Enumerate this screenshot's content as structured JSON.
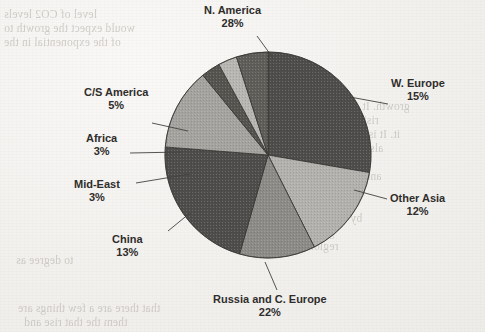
{
  "page": {
    "media": "scanned-document-page",
    "background_color": "#f2f1ee",
    "showthrough_text": [
      {
        "text": "level of CO2 levels",
        "x": 4,
        "y": 8
      },
      {
        "text": "would expect the growth to",
        "x": 4,
        "y": 22
      },
      {
        "text": "of the exponential in the",
        "x": 4,
        "y": 36
      },
      {
        "text": "in build-up in",
        "x": 272,
        "y": 86
      },
      {
        "text": "growth. It is the models",
        "x": 296,
        "y": 100
      },
      {
        "text": "rising levels and",
        "x": 300,
        "y": 114
      },
      {
        "text": "it. It is a very limit-",
        "x": 306,
        "y": 128
      },
      {
        "text": "also the rate of",
        "x": 312,
        "y": 142
      },
      {
        "text": "is of the only",
        "x": 304,
        "y": 156
      },
      {
        "text": "and rise to 20 per",
        "x": 298,
        "y": 170
      },
      {
        "text": "in the last a result",
        "x": 280,
        "y": 184
      },
      {
        "text": "as it is a sized",
        "x": 276,
        "y": 198
      },
      {
        "text": "by reduce to effects",
        "x": 268,
        "y": 212
      },
      {
        "text": "growth, without",
        "x": 258,
        "y": 226
      },
      {
        "text": "regional than the the",
        "x": 240,
        "y": 240
      },
      {
        "text": "to degree as",
        "x": 16,
        "y": 254
      },
      {
        "text": "that there are a few things are",
        "x": 18,
        "y": 302
      },
      {
        "text": "them the that rise and",
        "x": 24,
        "y": 316
      }
    ]
  },
  "chart_data": {
    "type": "pie",
    "title": "",
    "legend_position": "callout-labels",
    "grid": false,
    "total_percent": 101,
    "center": {
      "x": 268,
      "y": 155
    },
    "radius": 103,
    "start_angle_deg": 0,
    "direction": "clockwise",
    "categories": [
      "N. America",
      "W. Europe",
      "Other Asia",
      "Russia and C. Europe",
      "China",
      "Mid-East",
      "Africa",
      "C/S America"
    ],
    "values": [
      28,
      15,
      12,
      22,
      13,
      3,
      3,
      5
    ],
    "slices": [
      {
        "label": "N. America",
        "value": 28,
        "percent_text": "28%",
        "fill": "#4f4d4b",
        "label_pos": {
          "x": 204,
          "y": 4
        },
        "label_align": "center",
        "leader": {
          "x1": 257,
          "y1": 36,
          "x2": 273,
          "y2": 58
        }
      },
      {
        "label": "W. Europe",
        "value": 15,
        "percent_text": "15%",
        "fill": "#b3b1ad",
        "label_pos": {
          "x": 391,
          "y": 77
        },
        "label_align": "center",
        "leader": {
          "x1": 388,
          "y1": 104,
          "x2": 350,
          "y2": 97
        }
      },
      {
        "label": "Other Asia",
        "value": 12,
        "percent_text": "12%",
        "fill": "#8d8b88",
        "label_pos": {
          "x": 390,
          "y": 192
        },
        "label_align": "center",
        "leader": {
          "x1": 387,
          "y1": 199,
          "x2": 354,
          "y2": 190
        }
      },
      {
        "label": "Russia and C. Europe",
        "value": 22,
        "percent_text": "22%",
        "fill": "#4f4d4b",
        "label_pos": {
          "x": 213,
          "y": 293
        },
        "label_align": "center",
        "leader": {
          "x1": 277,
          "y1": 290,
          "x2": 265,
          "y2": 262
        }
      },
      {
        "label": "China",
        "value": 13,
        "percent_text": "13%",
        "fill": "#a5a39f",
        "label_pos": {
          "x": 112,
          "y": 233
        },
        "label_align": "center",
        "leader": {
          "x1": 168,
          "y1": 231,
          "x2": 190,
          "y2": 213
        }
      },
      {
        "label": "Mid-East",
        "value": 3,
        "percent_text": "3%",
        "fill": "#56544f",
        "label_pos": {
          "x": 74,
          "y": 178
        },
        "label_align": "center",
        "leader": {
          "x1": 136,
          "y1": 183,
          "x2": 190,
          "y2": 174
        }
      },
      {
        "label": "Africa",
        "value": 3,
        "percent_text": "3%",
        "fill": "#b8b6b2",
        "label_pos": {
          "x": 86,
          "y": 132
        },
        "label_align": "center",
        "leader": {
          "x1": 130,
          "y1": 153,
          "x2": 182,
          "y2": 152
        }
      },
      {
        "label": "C/S America",
        "value": 5,
        "percent_text": "5%",
        "fill": "#605e59",
        "label_pos": {
          "x": 84,
          "y": 86
        },
        "label_align": "center",
        "leader": {
          "x1": 152,
          "y1": 123,
          "x2": 188,
          "y2": 131
        }
      }
    ],
    "xlabel": "",
    "ylabel": ""
  }
}
